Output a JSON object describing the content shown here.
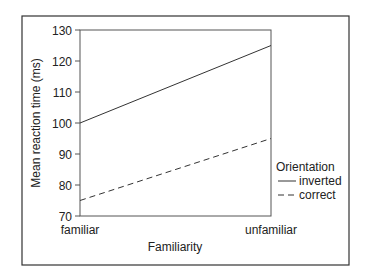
{
  "chart_data": {
    "type": "line",
    "title": "",
    "xlabel": "Familiarity",
    "ylabel": "Mean reaction time (ms)",
    "categories": [
      "familiar",
      "unfamiliar"
    ],
    "ylim": [
      70,
      130
    ],
    "yticks": [
      70,
      80,
      90,
      100,
      110,
      120,
      130
    ],
    "grid": false,
    "legend": {
      "title": "Orientation",
      "position": "right"
    },
    "series": [
      {
        "name": "inverted",
        "style": "solid",
        "values": [
          100,
          125
        ]
      },
      {
        "name": "correct",
        "style": "dashed",
        "values": [
          75,
          95
        ]
      }
    ]
  }
}
